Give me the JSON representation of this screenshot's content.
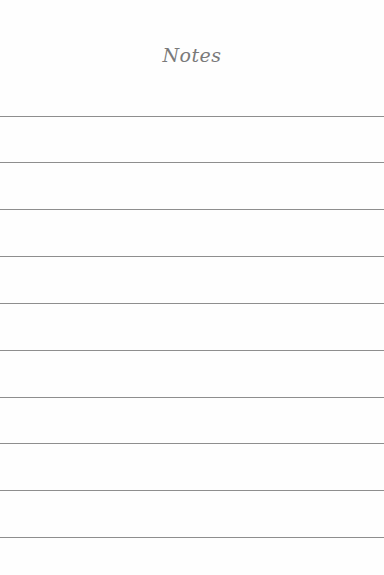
{
  "page": {
    "title": "Notes",
    "background_color": "#fefefe",
    "rule_color": "#8e8e8e",
    "rule_count": 10,
    "rule_positions_px": [
      116,
      162,
      209,
      256,
      303,
      350,
      397,
      443,
      490,
      537
    ]
  }
}
